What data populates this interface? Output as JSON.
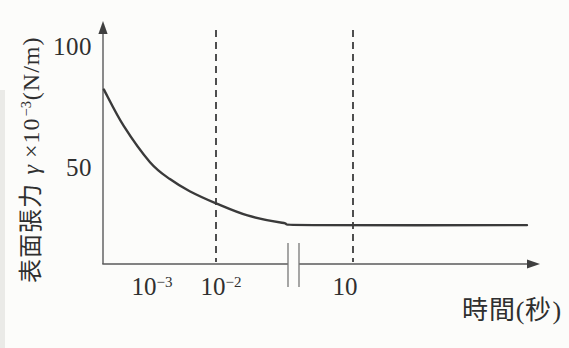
{
  "figure": {
    "background": "#fcfcfa",
    "ink_color": "#2f2f2f",
    "curve_color": "#3a3a3a",
    "axis_color": "#5a5a5a"
  },
  "y_axis": {
    "title": {
      "text": "表面張力",
      "symbol": "γ",
      "times": "×10",
      "exponent": "−3",
      "unit": "(N/m)"
    },
    "ticks": [
      {
        "label": "100",
        "value": 100
      },
      {
        "label": "50",
        "value": 50
      }
    ]
  },
  "x_axis": {
    "title": "時間(秒)",
    "ticks": [
      {
        "base": "10",
        "exponent": "−3",
        "value": 0.001
      },
      {
        "base": "10",
        "exponent": "−2",
        "value": 0.01
      },
      {
        "base": "10",
        "exponent": "",
        "value": 10
      }
    ],
    "scale": "log",
    "axis_break_between": [
      0.1,
      10
    ]
  },
  "chart_data": {
    "type": "line",
    "title": "",
    "xlabel": "時間(秒)",
    "ylabel": "表面張力 γ ×10⁻³(N/m)",
    "x_scale": "log",
    "x_ticks": [
      "10^-3",
      "10^-2",
      "10"
    ],
    "y_ticks": [
      50,
      100
    ],
    "ylim": [
      0,
      110
    ],
    "grid": false,
    "legend": "none",
    "guide_lines_x": [
      "10^-2",
      "10"
    ],
    "axis_break": {
      "between": [
        "10^-1",
        "10"
      ]
    },
    "series": [
      {
        "name": "dynamic-surface-tension",
        "points": [
          {
            "t": 0.0002,
            "gamma": 82
          },
          {
            "t": 0.0004,
            "gamma": 67
          },
          {
            "t": 0.001,
            "gamma": 52
          },
          {
            "t": 0.002,
            "gamma": 45
          },
          {
            "t": 0.004,
            "gamma": 40
          },
          {
            "t": 0.01,
            "gamma": 35
          },
          {
            "t": 0.03,
            "gamma": 30
          },
          {
            "t": 0.1,
            "gamma": 27
          },
          {
            "t": 0.3,
            "gamma": 26
          }
        ],
        "equilibrium_gamma": 26
      }
    ]
  }
}
